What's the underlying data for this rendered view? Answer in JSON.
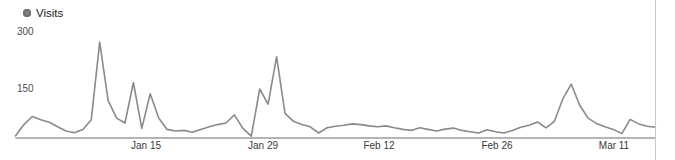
{
  "legend": {
    "label": "Visits",
    "dot_color": "#848484"
  },
  "y_axis": {
    "labels": [
      {
        "text": "300"
      },
      {
        "text": "150"
      }
    ]
  },
  "x_axis": {
    "labels": [
      {
        "text": "Jan 15"
      },
      {
        "text": "Jan 29"
      },
      {
        "text": "Feb 12"
      },
      {
        "text": "Feb 26"
      },
      {
        "text": "Mar 11"
      }
    ]
  },
  "colors": {
    "line": "#8a8a8a",
    "axis": "#9c9c9c",
    "divider": "#c9c9c9"
  },
  "chart_data": {
    "type": "line",
    "title": "Visits",
    "series": [
      {
        "name": "Visits",
        "values": [
          5,
          40,
          65,
          55,
          47,
          33,
          20,
          15,
          25,
          55,
          295,
          115,
          60,
          45,
          170,
          28,
          135,
          60,
          25,
          20,
          22,
          16,
          25,
          33,
          40,
          45,
          70,
          28,
          4,
          150,
          103,
          250,
          75,
          50,
          40,
          33,
          14,
          30,
          35,
          38,
          42,
          40,
          36,
          33,
          36,
          30,
          25,
          22,
          30,
          25,
          20,
          26,
          29,
          22,
          18,
          14,
          24,
          18,
          14,
          22,
          32,
          38,
          48,
          30,
          50,
          120,
          165,
          100,
          60,
          43,
          33,
          25,
          12,
          56,
          42,
          35,
          32
        ]
      }
    ],
    "x_tick_labels": [
      "Jan 15",
      "Jan 29",
      "Feb 12",
      "Feb 26",
      "Mar 11"
    ],
    "y_tick_labels": [
      "300",
      "150"
    ],
    "y_ticks": [
      300,
      150
    ],
    "ylim": [
      0,
      310
    ],
    "xlabel": "",
    "ylabel": "",
    "grid": false,
    "legend_position": "top-left",
    "line_color": "#8a8a8a"
  }
}
